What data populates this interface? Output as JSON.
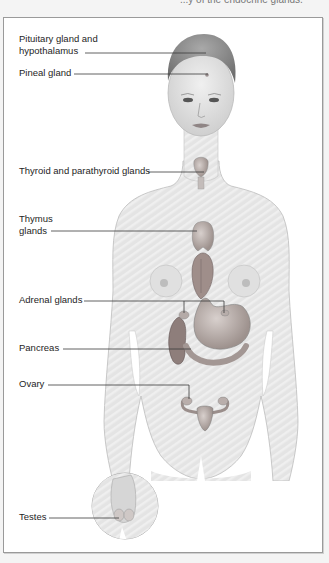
{
  "header": {
    "fragment_text": "...y of the endocrine glands."
  },
  "diagram": {
    "colors": {
      "frame_border": "#9a9a9a",
      "skin": "#e6e6e6",
      "skin_shadow": "#c9c9c9",
      "hair": "#8a8a8a",
      "organ": "#b9b0ad",
      "organ_dark": "#8c7e7a",
      "leader_line": "#3a3a3a"
    },
    "labels": [
      {
        "id": "pituitary",
        "lines": [
          "Pituitary gland and",
          "hypothalamus"
        ]
      },
      {
        "id": "pineal",
        "lines": [
          "Pineal gland"
        ]
      },
      {
        "id": "thyroid",
        "lines": [
          "Thyroid and parathyroid glands"
        ]
      },
      {
        "id": "thymus",
        "lines": [
          "Thymus",
          "glands"
        ]
      },
      {
        "id": "adrenal",
        "lines": [
          "Adrenal glands"
        ]
      },
      {
        "id": "pancreas",
        "lines": [
          "Pancreas"
        ]
      },
      {
        "id": "ovary",
        "lines": [
          "Ovary"
        ]
      },
      {
        "id": "testes",
        "lines": [
          "Testes"
        ]
      }
    ]
  }
}
